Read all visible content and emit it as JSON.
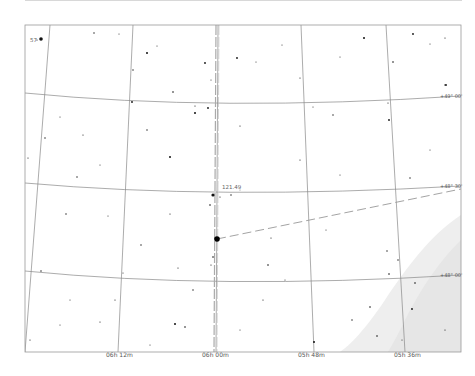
{
  "chart_type": "star-finder-chart",
  "frame": {
    "left": 25,
    "top": 25,
    "right": 461,
    "bottom": 352
  },
  "colors": {
    "background": "#ffffff",
    "grid": "#888888",
    "frame": "#999999",
    "milky_way": "#eeeeee",
    "star": "#111111",
    "dashed_path": "#999999",
    "label": "#555555"
  },
  "ra_labels": [
    {
      "text": "06h 12m",
      "x": 116
    },
    {
      "text": "06h 00m",
      "x": 212
    },
    {
      "text": "05h 48m",
      "x": 314
    },
    {
      "text": "05h 36m",
      "x": 407
    }
  ],
  "dec_labels": [
    {
      "text": "+49° 00'",
      "y": 97
    },
    {
      "text": "+48° 30'",
      "y": 186
    },
    {
      "text": "+48° 00'",
      "y": 275
    }
  ],
  "object": {
    "label": "121.49",
    "x": 216,
    "y": 239
  },
  "corner_label": {
    "text": "57",
    "x": 33,
    "y": 40
  }
}
